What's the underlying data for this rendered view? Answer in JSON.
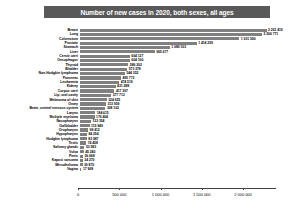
{
  "chart": {
    "title": "Number of new cases in 2020, both sexes, all ages"
  },
  "axis": {
    "ticks": [
      "0",
      "500 000",
      "1 000 000",
      "1 500 000",
      "2 000 000"
    ]
  },
  "chart_data": {
    "type": "bar",
    "orientation": "horizontal",
    "title": "Number of new cases in 2020, both sexes, all ages",
    "xlabel": "",
    "ylabel": "",
    "xlim": [
      0,
      2400000
    ],
    "grid": false,
    "legend": false,
    "bar_color": "#808080",
    "title_band_color": "#595959",
    "categories": [
      "Breast",
      "Lung",
      "Colorectum",
      "Prostate",
      "Stomach",
      "Liver",
      "Cervix uteri",
      "Oesophagus",
      "Thyroid",
      "Bladder",
      "Non-Hodgkin lymphoma",
      "Pancreas",
      "Leukaemia",
      "Kidney",
      "Corpus uteri",
      "Lip, oral cavity",
      "Melanoma of skin",
      "Ovary",
      "Brain, central nervous system",
      "Larynx",
      "Multiple myeloma",
      "Nasopharynx",
      "Gallbladder",
      "Oropharynx",
      "Hypopharynx",
      "Hodgkin lymphoma",
      "Testis",
      "Salivary glands",
      "Vulva",
      "Penis",
      "Kaposi sarcoma",
      "Mesothelioma",
      "Vagina"
    ],
    "values": [
      2261419,
      2206771,
      1931590,
      1414259,
      1089103,
      905677,
      604127,
      604100,
      586202,
      573278,
      544352,
      495773,
      474519,
      431288,
      417367,
      377713,
      324635,
      313959,
      308102,
      184615,
      176404,
      133354,
      115949,
      98412,
      84254,
      83087,
      74458,
      53583,
      45240,
      36068,
      34270,
      30870,
      17908
    ],
    "value_labels": [
      "2 261 419",
      "2 206 771",
      "1 931 590",
      "1 414 259",
      "1 089 103",
      "905 677",
      "604 127",
      "604 100",
      "586 202",
      "573 278",
      "544 352",
      "495 773",
      "474 519",
      "431 288",
      "417 367",
      "377 713",
      "324 635",
      "313 959",
      "308 102",
      "184 615",
      "176 404",
      "133 354",
      "115 949",
      "98 412",
      "84 254",
      "83 087",
      "74 458",
      "53 583",
      "45 240",
      "36 068",
      "34 270",
      "30 870",
      "17 908"
    ]
  }
}
